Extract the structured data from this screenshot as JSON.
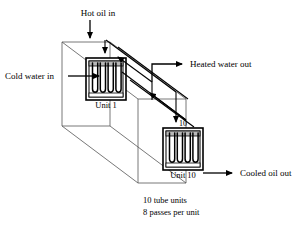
{
  "diagram": {
    "labels": {
      "hot_oil_in": "Hot oil in",
      "cold_water_in": "Cold water in",
      "heated_water_out": "Heated water out",
      "cooled_oil_out": "Cooled oil out",
      "unit_first": "Unit 1",
      "unit_last": "Unit 10",
      "unit_last_number": "10"
    },
    "notes": {
      "line1": "10  tube units",
      "line2": "8 passes per unit"
    },
    "colors": {
      "ink": "#000000",
      "shell_outline": "#555555",
      "header_fill": "#b8b8b8",
      "background": "#ffffff"
    },
    "units": {
      "count": 10,
      "passes_per_unit": 8
    },
    "streams": [
      {
        "name": "hot-oil-in",
        "label": "Hot oil in",
        "direction": "down-into-unit-1"
      },
      {
        "name": "cold-water-in",
        "label": "Cold water in",
        "direction": "right-into-shell"
      },
      {
        "name": "heated-water-out",
        "label": "Heated water out",
        "direction": "right-out-of-shell"
      },
      {
        "name": "cooled-oil-out",
        "label": "Cooled oil out",
        "direction": "right-out-of-unit-10"
      }
    ]
  }
}
